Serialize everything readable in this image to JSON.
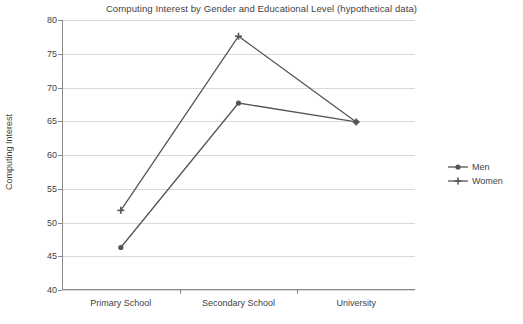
{
  "chart_data": {
    "type": "line",
    "title": "Computing Interest by Gender and Educational Level (hypothetical data)",
    "xlabel": "",
    "ylabel": "Computing Interest",
    "categories": [
      "Primary School",
      "Secondary School",
      "University"
    ],
    "series": [
      {
        "name": "Men",
        "marker": "filled-circle",
        "color": "#555555",
        "values": [
          46.3,
          67.7,
          64.9
        ]
      },
      {
        "name": "Women",
        "marker": "plus",
        "color": "#555555",
        "values": [
          51.8,
          77.6,
          64.9
        ]
      }
    ],
    "ylim": [
      40,
      80
    ],
    "yticks": [
      40,
      45,
      50,
      55,
      60,
      65,
      70,
      75,
      80
    ],
    "ytick_labels": [
      "40",
      "45",
      "50",
      "55",
      "60",
      "65",
      "70",
      "75",
      "80"
    ],
    "grid": true,
    "legend_position": "right",
    "legend_entries": [
      "Men",
      "Women"
    ]
  },
  "colors": {
    "line": "#555555",
    "grid": "#d9d9d9",
    "axis": "#8a8a8a",
    "text": "#3f3f3f",
    "background": "#ffffff"
  }
}
